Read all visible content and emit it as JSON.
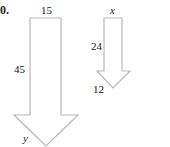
{
  "problem": {
    "number_label": "0."
  },
  "large_arrow": {
    "top_width_label": "15",
    "shaft_length_label": "45",
    "head_side_label": "y",
    "stroke_color": "#b8b8b8"
  },
  "small_arrow": {
    "top_width_label": "x",
    "shaft_length_label": "24",
    "head_side_label": "12",
    "stroke_color": "#b8b8b8"
  }
}
